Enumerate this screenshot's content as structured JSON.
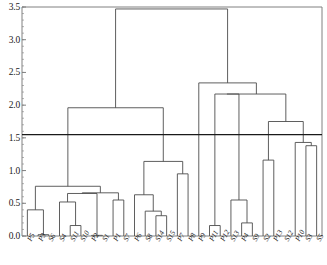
{
  "chart_data": {
    "type": "dendrogram",
    "title": "",
    "xlabel": "",
    "ylabel": "",
    "ylim": [
      0.0,
      3.5
    ],
    "yticks": [
      0.0,
      0.5,
      1.0,
      1.5,
      2.0,
      2.5,
      3.0,
      3.5
    ],
    "ytick_labels": [
      "0.0",
      "0.5",
      "1.0",
      "1.5",
      "2.0",
      "2.5",
      "3.0",
      "3.5"
    ],
    "grid": false,
    "legend": "none",
    "leaf_labels": [
      "P5",
      "P3",
      "S6",
      "S4",
      "S11",
      "S10",
      "P2",
      "S1",
      "P1",
      "S7",
      "P6",
      "S8",
      "S14",
      "S15",
      "P7",
      "P8",
      "P9",
      "P11",
      "P12",
      "S13",
      "P4",
      "S9",
      "S2",
      "P13",
      "S12",
      "P10",
      "S3",
      "S5"
    ],
    "cut_line": {
      "value": 1.55,
      "orientation": "horizontal"
    },
    "merges": [
      {
        "id": "m1",
        "left": "P3",
        "right": "S6",
        "height": 0.02
      },
      {
        "id": "m2",
        "left": "P5",
        "right": "m1",
        "height": 0.4
      },
      {
        "id": "m3",
        "left": "S11",
        "right": "S10",
        "height": 0.16
      },
      {
        "id": "m4",
        "left": "S4",
        "right": "m3",
        "height": 0.52
      },
      {
        "id": "m5",
        "left": "P2",
        "right": "S1",
        "height": 0.01
      },
      {
        "id": "m6",
        "left": "m4",
        "right": "m5",
        "height": 0.65
      },
      {
        "id": "m7",
        "left": "P1",
        "right": "S7",
        "height": 0.55
      },
      {
        "id": "m8",
        "left": "m6",
        "right": "m7",
        "height": 0.66
      },
      {
        "id": "m9",
        "left": "m2",
        "right": "m8",
        "height": 0.76
      },
      {
        "id": "m10",
        "left": "S14",
        "right": "S15",
        "height": 0.31
      },
      {
        "id": "m11",
        "left": "S8",
        "right": "m10",
        "height": 0.38
      },
      {
        "id": "m12",
        "left": "P6",
        "right": "m11",
        "height": 0.63
      },
      {
        "id": "m13",
        "left": "P7",
        "right": "P8",
        "height": 0.95
      },
      {
        "id": "m14",
        "left": "m12",
        "right": "m13",
        "height": 1.14
      },
      {
        "id": "m15",
        "left": "m9",
        "right": "m14",
        "height": 1.96
      },
      {
        "id": "m16",
        "left": "P11",
        "right": "P12",
        "height": 0.16
      },
      {
        "id": "m17",
        "left": "P4",
        "right": "S9",
        "height": 0.2
      },
      {
        "id": "m18",
        "left": "S13",
        "right": "m17",
        "height": 0.55
      },
      {
        "id": "m19",
        "left": "m16",
        "right": "m18",
        "height": 2.17
      },
      {
        "id": "m20",
        "left": "S2",
        "right": "P13",
        "height": 1.16
      },
      {
        "id": "m21",
        "left": "S3",
        "right": "S5",
        "height": 1.38
      },
      {
        "id": "m22",
        "left": "P10",
        "right": "m21",
        "height": 1.43
      },
      {
        "id": "m23",
        "left": "m20",
        "right": "m22",
        "height": 1.75
      },
      {
        "id": "m24",
        "left": "m19",
        "right": "m23",
        "height": 2.17
      },
      {
        "id": "m25",
        "left": "P9",
        "right": "m24",
        "height": 2.34
      },
      {
        "id": "m26",
        "left": "m15",
        "right": "m25",
        "height": 3.47
      }
    ],
    "colors": {
      "line": "#4d4d4d",
      "cut_line": "#1a1a1a",
      "axis": "#808080",
      "text": "#1a1a1a",
      "background": "#ffffff"
    }
  }
}
